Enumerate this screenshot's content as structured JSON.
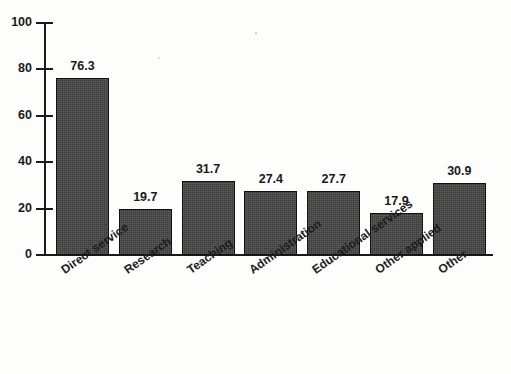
{
  "chart_data": {
    "type": "bar",
    "title": "",
    "xlabel": "",
    "ylabel": "",
    "categories": [
      "Direct service",
      "Research",
      "Teaching",
      "Administration",
      "Educational services",
      "Other applied",
      "Other"
    ],
    "values": [
      76.3,
      19.7,
      31.7,
      27.4,
      27.7,
      17.9,
      30.9
    ],
    "value_labels": [
      "76.3",
      "19.7",
      "31.7",
      "27.4",
      "27.7",
      "17.9",
      "30.9"
    ],
    "ylim": [
      0,
      100
    ],
    "ytick_values": [
      0,
      20,
      40,
      60,
      80,
      100
    ],
    "ytick_labels": [
      "0",
      "20",
      "40",
      "60",
      "80",
      "100"
    ],
    "grid": false,
    "legend": null,
    "legend_position": "none",
    "series": [
      {
        "name": "",
        "values": [
          76.3,
          19.7,
          31.7,
          27.4,
          27.7,
          17.9,
          30.9
        ]
      }
    ],
    "colors": {
      "bar_fill": "#3b3b3b",
      "bar_border": "#101010",
      "axis": "#1b1b1b",
      "text": "#1a1a1a",
      "background": "#fdfdfb"
    }
  }
}
